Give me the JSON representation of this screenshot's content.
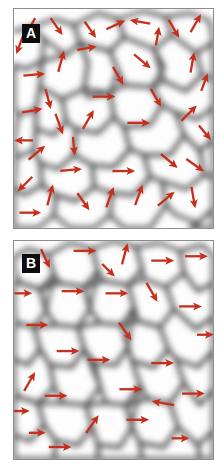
{
  "figure": {
    "kind": "two-panel micrograph figure",
    "background_color": "#ffffff",
    "panel_border_color": "#8c8c8c"
  },
  "panels": [
    {
      "id": "panel-a",
      "badge_label": "A",
      "badge_bg": "#0d0d0d",
      "badge_fg": "#ffffff",
      "arrow_color": "#c62f1c",
      "description": "Granular microstructure with randomly oriented magnetization arrows",
      "grain_fill_light": "#ffffff",
      "grain_boundary_dark": "#4a4a4a"
    },
    {
      "id": "panel-b",
      "badge_label": "B",
      "badge_bg": "#0d0d0d",
      "badge_fg": "#ffffff",
      "arrow_color": "#c62f1c",
      "description": "Granular microstructure with predominantly rightward aligned magnetization arrows",
      "grain_fill_light": "#ffffff",
      "grain_boundary_dark": "#4a4a4a"
    }
  ],
  "chart_data": {
    "type": "scatter",
    "title": "",
    "xlabel": "",
    "ylabel": "",
    "legend": [],
    "grid": false,
    "panel_a": {
      "label": "A",
      "arrow_color": "#c62f1c",
      "arrow_count": 40,
      "note": "angles in degrees, 0 = pointing right, counter-clockwise positive; x,y are fractional panel coordinates",
      "arrows": [
        {
          "x": 0.085,
          "y": 0.075,
          "angle": -120,
          "len": 17
        },
        {
          "x": 0.21,
          "y": 0.075,
          "angle": -55,
          "len": 18
        },
        {
          "x": 0.38,
          "y": 0.09,
          "angle": -55,
          "len": 17
        },
        {
          "x": 0.505,
          "y": 0.075,
          "angle": 25,
          "len": 18
        },
        {
          "x": 0.64,
          "y": 0.06,
          "angle": 170,
          "len": 18
        },
        {
          "x": 0.8,
          "y": 0.085,
          "angle": -60,
          "len": 18
        },
        {
          "x": 0.91,
          "y": 0.07,
          "angle": 60,
          "len": 18
        },
        {
          "x": 0.235,
          "y": 0.245,
          "angle": 75,
          "len": 19
        },
        {
          "x": 0.64,
          "y": 0.235,
          "angle": -40,
          "len": 19
        },
        {
          "x": 0.895,
          "y": 0.25,
          "angle": 80,
          "len": 18
        },
        {
          "x": 0.095,
          "y": 0.3,
          "angle": 5,
          "len": 19
        },
        {
          "x": 0.445,
          "y": 0.4,
          "angle": 0,
          "len": 20
        },
        {
          "x": 0.71,
          "y": 0.4,
          "angle": -60,
          "len": 18
        },
        {
          "x": 0.085,
          "y": 0.465,
          "angle": 10,
          "len": 18
        },
        {
          "x": 0.225,
          "y": 0.52,
          "angle": -70,
          "len": 19
        },
        {
          "x": 0.37,
          "y": 0.51,
          "angle": 60,
          "len": 19
        },
        {
          "x": 0.62,
          "y": 0.52,
          "angle": 0,
          "len": 20
        },
        {
          "x": 0.875,
          "y": 0.48,
          "angle": 45,
          "len": 19
        },
        {
          "x": 0.11,
          "y": 0.66,
          "angle": 40,
          "len": 19
        },
        {
          "x": 0.28,
          "y": 0.735,
          "angle": 5,
          "len": 19
        },
        {
          "x": 0.545,
          "y": 0.74,
          "angle": 0,
          "len": 20
        },
        {
          "x": 0.775,
          "y": 0.69,
          "angle": -40,
          "len": 19
        },
        {
          "x": 0.905,
          "y": 0.71,
          "angle": -35,
          "len": 19
        },
        {
          "x": 0.06,
          "y": 0.795,
          "angle": -135,
          "len": 18
        },
        {
          "x": 0.18,
          "y": 0.855,
          "angle": 75,
          "len": 19
        },
        {
          "x": 0.345,
          "y": 0.875,
          "angle": -55,
          "len": 18
        },
        {
          "x": 0.48,
          "y": 0.865,
          "angle": 70,
          "len": 19
        },
        {
          "x": 0.625,
          "y": 0.855,
          "angle": 70,
          "len": 19
        },
        {
          "x": 0.76,
          "y": 0.87,
          "angle": 40,
          "len": 19
        },
        {
          "x": 0.9,
          "y": 0.855,
          "angle": -80,
          "len": 19
        },
        {
          "x": 0.075,
          "y": 0.93,
          "angle": 0,
          "len": 19
        },
        {
          "x": 0.055,
          "y": 0.6,
          "angle": 180,
          "len": 16
        },
        {
          "x": 0.52,
          "y": 0.3,
          "angle": -60,
          "len": 18
        },
        {
          "x": 0.955,
          "y": 0.34,
          "angle": 70,
          "len": 16
        },
        {
          "x": 0.36,
          "y": 0.18,
          "angle": 10,
          "len": 17
        },
        {
          "x": 0.72,
          "y": 0.13,
          "angle": 80,
          "len": 16
        },
        {
          "x": 0.17,
          "y": 0.405,
          "angle": -75,
          "len": 18
        },
        {
          "x": 0.03,
          "y": 0.16,
          "angle": -110,
          "len": 16
        },
        {
          "x": 0.955,
          "y": 0.56,
          "angle": -50,
          "len": 16
        },
        {
          "x": 0.3,
          "y": 0.62,
          "angle": -85,
          "len": 16
        }
      ]
    },
    "panel_b": {
      "label": "B",
      "arrow_color": "#c62f1c",
      "arrow_count": 28,
      "note": "angles in degrees, 0 = pointing right; majority near 0 indicating alignment",
      "arrows": [
        {
          "x": 0.155,
          "y": 0.075,
          "angle": -65,
          "len": 18
        },
        {
          "x": 0.35,
          "y": 0.045,
          "angle": 0,
          "len": 20
        },
        {
          "x": 0.555,
          "y": 0.065,
          "angle": 75,
          "len": 19
        },
        {
          "x": 0.74,
          "y": 0.09,
          "angle": 0,
          "len": 20
        },
        {
          "x": 0.91,
          "y": 0.07,
          "angle": 0,
          "len": 20
        },
        {
          "x": 0.29,
          "y": 0.23,
          "angle": 0,
          "len": 20
        },
        {
          "x": 0.51,
          "y": 0.24,
          "angle": 0,
          "len": 20
        },
        {
          "x": 0.69,
          "y": 0.23,
          "angle": -60,
          "len": 19
        },
        {
          "x": 0.88,
          "y": 0.3,
          "angle": 0,
          "len": 20
        },
        {
          "x": 0.11,
          "y": 0.385,
          "angle": 0,
          "len": 19
        },
        {
          "x": 0.555,
          "y": 0.41,
          "angle": -55,
          "len": 19
        },
        {
          "x": 0.265,
          "y": 0.505,
          "angle": 0,
          "len": 20
        },
        {
          "x": 0.42,
          "y": 0.545,
          "angle": 0,
          "len": 20
        },
        {
          "x": 0.74,
          "y": 0.56,
          "angle": 0,
          "len": 20
        },
        {
          "x": 0.075,
          "y": 0.65,
          "angle": 60,
          "len": 19
        },
        {
          "x": 0.205,
          "y": 0.71,
          "angle": 0,
          "len": 20
        },
        {
          "x": 0.58,
          "y": 0.68,
          "angle": 0,
          "len": 20
        },
        {
          "x": 0.895,
          "y": 0.7,
          "angle": 0,
          "len": 20
        },
        {
          "x": 0.755,
          "y": 0.745,
          "angle": 170,
          "len": 20
        },
        {
          "x": 0.39,
          "y": 0.845,
          "angle": 55,
          "len": 19
        },
        {
          "x": 0.615,
          "y": 0.82,
          "angle": 0,
          "len": 20
        },
        {
          "x": 0.225,
          "y": 0.945,
          "angle": 0,
          "len": 20
        },
        {
          "x": 0.04,
          "y": 0.24,
          "angle": 0,
          "len": 15
        },
        {
          "x": 0.955,
          "y": 0.43,
          "angle": 0,
          "len": 14
        },
        {
          "x": 0.03,
          "y": 0.78,
          "angle": 0,
          "len": 14
        },
        {
          "x": 0.47,
          "y": 0.13,
          "angle": -45,
          "len": 15
        },
        {
          "x": 0.83,
          "y": 0.905,
          "angle": 0,
          "len": 15
        },
        {
          "x": 0.11,
          "y": 0.88,
          "angle": 0,
          "len": 14
        }
      ]
    }
  }
}
